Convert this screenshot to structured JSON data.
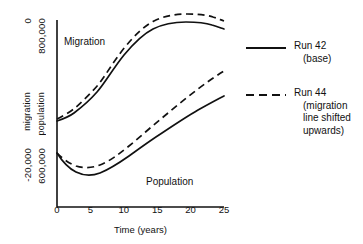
{
  "chart_data": {
    "type": "line",
    "title": "",
    "xlabel": "Time (years)",
    "ylabel_left_outer": "migration",
    "ylabel_left_inner": "population",
    "xlim": [
      0,
      25
    ],
    "xticks": [
      0,
      5,
      10,
      15,
      20,
      25
    ],
    "xticklabels": [
      "0",
      "5",
      "10",
      "15",
      "20",
      "25"
    ],
    "grid": false,
    "legend_position": "right",
    "y_axis_outer": {
      "name": "migration",
      "top_label": "0",
      "bottom_label": "-20,000",
      "range": [
        -20000,
        0
      ]
    },
    "y_axis_inner": {
      "name": "population",
      "top_label": "800,000",
      "bottom_label": "600,000",
      "range": [
        600000,
        800000
      ]
    },
    "annotations": [
      {
        "text": "Migration",
        "x": 1.5,
        "y_region": "upper"
      },
      {
        "text": "Population",
        "x": 14.0,
        "y_region": "lower"
      }
    ],
    "series": [
      {
        "name": "Migration — Run 42",
        "group": "Migration",
        "run": "Run 42",
        "style": "solid",
        "axis": "migration",
        "x": [
          0,
          2.5,
          5,
          7.5,
          10,
          12.5,
          15,
          17.5,
          20,
          22.5,
          25
        ],
        "values": [
          -10700,
          -10400,
          -9900,
          -9100,
          -8000,
          -6600,
          -5000,
          -3700,
          -2900,
          -2600,
          -2700
        ]
      },
      {
        "name": "Migration — Run 44",
        "group": "Migration",
        "run": "Run 44",
        "style": "dashed",
        "axis": "migration",
        "x": [
          0,
          2.5,
          5,
          7.5,
          10,
          12.5,
          15,
          17.5,
          20,
          22.5,
          25
        ],
        "values": [
          -10600,
          -10200,
          -9600,
          -8600,
          -7200,
          -5700,
          -4200,
          -3100,
          -2400,
          -2100,
          -2200
        ]
      },
      {
        "name": "Population — Run 42",
        "group": "Population",
        "run": "Run 42",
        "style": "solid",
        "axis": "population",
        "x": [
          0,
          2.5,
          5,
          7.5,
          10,
          12.5,
          15,
          17.5,
          20,
          22.5,
          25
        ],
        "values": [
          673000,
          661000,
          657000,
          658000,
          663000,
          670000,
          678000,
          687000,
          696000,
          704000,
          711000
        ]
      },
      {
        "name": "Population — Run 44",
        "group": "Population",
        "run": "Run 44",
        "style": "dashed",
        "axis": "population",
        "x": [
          0,
          2.5,
          5,
          7.5,
          10,
          12.5,
          15,
          17.5,
          20,
          22.5,
          25
        ],
        "values": [
          673000,
          666000,
          664000,
          666000,
          673000,
          683000,
          695000,
          707000,
          719000,
          730000,
          739000
        ]
      }
    ]
  },
  "axes": {
    "y_top_outer": "0",
    "y_top_inner": "800,000",
    "y_bottom_outer": "-20,000",
    "y_bottom_inner": "600,000",
    "y_title_outer": "migration",
    "y_title_inner": "population",
    "x_title": "Time (years)",
    "x_tick_labels": [
      "0",
      "5",
      "10",
      "15",
      "20",
      "25"
    ]
  },
  "annotations": {
    "migration": "Migration",
    "population": "Population"
  },
  "legend": {
    "entries": [
      {
        "style": "solid",
        "line1": "Run 42",
        "line2": "(base)",
        "line3": "",
        "line4": ""
      },
      {
        "style": "dashed",
        "line1": "Run 44",
        "line2": "(migration",
        "line3": "line shifted",
        "line4": "upwards)"
      }
    ]
  },
  "colors": {
    "ink": "#111111",
    "background": "#ffffff"
  }
}
